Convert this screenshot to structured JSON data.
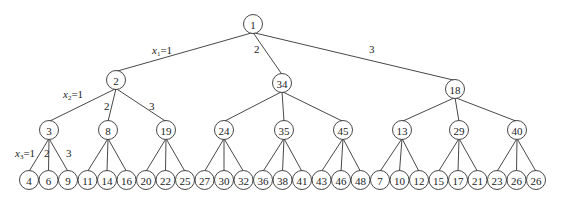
{
  "tree": {
    "root": {
      "label": "1",
      "x": 253,
      "y": 24
    },
    "level1": [
      {
        "label": "2",
        "x": 116,
        "y": 80
      },
      {
        "label": "34",
        "x": 282,
        "y": 83
      },
      {
        "label": "18",
        "x": 455,
        "y": 89
      }
    ],
    "level2": [
      {
        "label": "3",
        "x": 49,
        "y": 130,
        "parent": 0
      },
      {
        "label": "8",
        "x": 108,
        "y": 130,
        "parent": 0
      },
      {
        "label": "19",
        "x": 166,
        "y": 130,
        "parent": 0
      },
      {
        "label": "24",
        "x": 224,
        "y": 130,
        "parent": 1
      },
      {
        "label": "35",
        "x": 284,
        "y": 130,
        "parent": 1
      },
      {
        "label": "45",
        "x": 343,
        "y": 130,
        "parent": 1
      },
      {
        "label": "13",
        "x": 402,
        "y": 130,
        "parent": 2
      },
      {
        "label": "29",
        "x": 459,
        "y": 130,
        "parent": 2
      },
      {
        "label": "40",
        "x": 517,
        "y": 130,
        "parent": 2
      }
    ],
    "leaves": [
      "4",
      "6",
      "9",
      "11",
      "14",
      "16",
      "20",
      "22",
      "25",
      "27",
      "30",
      "32",
      "36",
      "38",
      "41",
      "43",
      "46",
      "48",
      "7",
      "10",
      "12",
      "15",
      "17",
      "21",
      "23",
      "26",
      "26"
    ],
    "leaf_start_x": 29,
    "leaf_spacing": 19.5,
    "leaf_y": 180,
    "node_radius": 9.5
  },
  "edge_labels": [
    {
      "var": "x",
      "sub": "1",
      "text": "=1",
      "x": 152,
      "y": 54
    },
    {
      "plain": "2",
      "x": 254,
      "y": 53
    },
    {
      "plain": "3",
      "x": 369,
      "y": 53
    },
    {
      "var": "x",
      "sub": "2",
      "text": "=1",
      "x": 63,
      "y": 98
    },
    {
      "plain": "2",
      "x": 104,
      "y": 110
    },
    {
      "plain": "3",
      "x": 149,
      "y": 110
    },
    {
      "var": "x",
      "sub": "3",
      "text": "=1",
      "x": 15,
      "y": 157
    },
    {
      "plain": "2",
      "x": 44,
      "y": 157
    },
    {
      "plain": "3",
      "x": 66,
      "y": 157
    }
  ]
}
